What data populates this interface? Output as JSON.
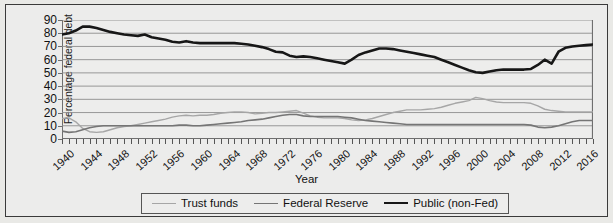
{
  "chart_data": {
    "type": "line",
    "title": "",
    "xlabel": "Year",
    "ylabel": "Percentage federal debt",
    "ylim": [
      0,
      90
    ],
    "ytick_step": 10,
    "yticks": [
      0,
      10,
      20,
      30,
      40,
      50,
      60,
      70,
      80,
      90
    ],
    "xlim": [
      1940,
      2017
    ],
    "xticks": [
      1940,
      1944,
      1948,
      1952,
      1956,
      1960,
      1964,
      1968,
      1972,
      1976,
      1980,
      1984,
      1988,
      1992,
      1996,
      2000,
      2004,
      2008,
      2012,
      2016
    ],
    "minor_xtick_step": 1,
    "grid": "horizontal",
    "legend_position": "bottom-center",
    "x": [
      1940,
      1941,
      1942,
      1943,
      1944,
      1945,
      1946,
      1947,
      1948,
      1949,
      1950,
      1951,
      1952,
      1953,
      1954,
      1955,
      1956,
      1957,
      1958,
      1959,
      1960,
      1961,
      1962,
      1963,
      1964,
      1965,
      1966,
      1967,
      1968,
      1969,
      1970,
      1971,
      1972,
      1973,
      1974,
      1975,
      1976,
      1977,
      1978,
      1979,
      1980,
      1981,
      1982,
      1983,
      1984,
      1985,
      1986,
      1987,
      1988,
      1989,
      1990,
      1991,
      1992,
      1993,
      1994,
      1995,
      1996,
      1997,
      1998,
      1999,
      2000,
      2001,
      2002,
      2003,
      2004,
      2005,
      2006,
      2007,
      2008,
      2009,
      2010,
      2011,
      2012,
      2013,
      2014,
      2015,
      2016,
      2017
    ],
    "series": [
      {
        "name": "Trust funds",
        "color": "#a6a6a6",
        "width": 1.4,
        "values": [
          15.5,
          16.0,
          13.0,
          8.0,
          5.5,
          5.0,
          5.5,
          7.0,
          8.5,
          9.5,
          10.0,
          11.0,
          12.0,
          13.0,
          14.0,
          15.0,
          16.5,
          17.5,
          18.0,
          17.5,
          18.0,
          18.0,
          18.5,
          19.5,
          20.0,
          20.5,
          20.5,
          20.0,
          19.0,
          19.5,
          20.0,
          20.0,
          20.5,
          21.0,
          21.5,
          19.5,
          17.5,
          16.5,
          16.0,
          16.0,
          16.0,
          15.5,
          14.5,
          14.0,
          14.5,
          15.5,
          17.0,
          18.5,
          20.0,
          21.0,
          22.0,
          22.0,
          22.0,
          22.5,
          23.0,
          24.0,
          25.5,
          27.0,
          28.0,
          29.0,
          31.5,
          30.5,
          29.0,
          28.0,
          27.5,
          27.5,
          27.5,
          27.5,
          27.0,
          25.0,
          22.5,
          21.5,
          21.0,
          20.5,
          20.5,
          20.5,
          20.5,
          20.5
        ]
      },
      {
        "name": "Federal Reserve",
        "color": "#757575",
        "width": 1.6,
        "values": [
          6.0,
          5.0,
          5.5,
          7.0,
          8.5,
          9.5,
          10.0,
          10.0,
          10.0,
          10.0,
          10.0,
          10.0,
          10.0,
          10.0,
          10.0,
          10.0,
          10.0,
          10.5,
          10.5,
          10.0,
          10.0,
          10.5,
          11.0,
          11.5,
          12.0,
          12.5,
          13.0,
          14.0,
          14.5,
          15.0,
          16.0,
          17.0,
          18.0,
          18.5,
          18.5,
          17.5,
          17.0,
          17.0,
          17.0,
          17.0,
          17.0,
          16.5,
          16.0,
          15.0,
          14.0,
          13.5,
          13.0,
          12.5,
          12.0,
          11.5,
          11.0,
          11.0,
          11.0,
          11.0,
          11.0,
          11.0,
          11.0,
          11.0,
          11.0,
          11.0,
          11.0,
          11.0,
          11.0,
          11.0,
          11.0,
          11.0,
          11.0,
          11.0,
          10.5,
          9.0,
          8.5,
          9.0,
          10.0,
          11.5,
          13.0,
          14.0,
          14.0,
          14.0
        ]
      },
      {
        "name": "Public (non-Fed)",
        "color": "#171717",
        "width": 2.6,
        "values": [
          79.0,
          80.0,
          82.0,
          85.0,
          85.0,
          84.0,
          82.5,
          81.0,
          80.0,
          79.0,
          78.5,
          78.0,
          79.0,
          77.0,
          76.0,
          75.0,
          73.5,
          73.0,
          74.0,
          73.0,
          72.5,
          72.5,
          72.5,
          72.5,
          72.5,
          72.5,
          72.0,
          71.5,
          70.5,
          69.5,
          68.0,
          66.0,
          65.5,
          63.0,
          62.0,
          62.5,
          62.0,
          61.0,
          60.0,
          59.0,
          58.0,
          57.0,
          60.0,
          63.5,
          65.5,
          67.0,
          68.5,
          68.5,
          68.0,
          67.0,
          66.0,
          65.0,
          64.0,
          63.0,
          62.0,
          60.0,
          58.0,
          56.0,
          54.0,
          52.0,
          50.5,
          50.0,
          51.0,
          52.0,
          52.5,
          52.5,
          52.5,
          52.5,
          53.0,
          56.0,
          60.0,
          57.0,
          66.0,
          69.0,
          70.0,
          70.5,
          71.0,
          71.5
        ]
      }
    ]
  },
  "legend": {
    "items": [
      {
        "label": "Trust funds"
      },
      {
        "label": "Federal Reserve"
      },
      {
        "label": "Public (non-Fed)"
      }
    ]
  }
}
